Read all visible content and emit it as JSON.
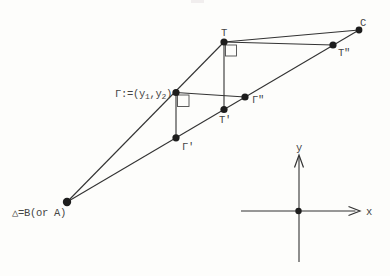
{
  "figure": {
    "canvas": {
      "width": 390,
      "height": 276
    },
    "colors": {
      "background": "#fdfdfb",
      "line": "#333333",
      "dot": "#1d1d1d",
      "text": "#454545",
      "marker": "#4a4a4a",
      "artifact": "#f1eeee"
    },
    "points": [
      {
        "id": "delta",
        "x": 67,
        "y": 202,
        "r": 4.2
      },
      {
        "id": "gamma",
        "x": 176,
        "y": 92.5,
        "r": 3.6
      },
      {
        "id": "gamma-prime",
        "x": 176,
        "y": 137.8,
        "r": 3.6
      },
      {
        "id": "t",
        "x": 224,
        "y": 42,
        "r": 3.6
      },
      {
        "id": "t-prime",
        "x": 224,
        "y": 109.5,
        "r": 3.6
      },
      {
        "id": "gamma-double-prime",
        "x": 245,
        "y": 97,
        "r": 3.6
      },
      {
        "id": "t-double-prime",
        "x": 333,
        "y": 45,
        "r": 3.6
      },
      {
        "id": "c",
        "x": 359,
        "y": 30,
        "r": 3.4
      },
      {
        "id": "axes-origin",
        "x": 298.5,
        "y": 211,
        "r": 3.2
      }
    ],
    "edges": [
      {
        "id": "delta-to-t",
        "x1": 67,
        "y1": 202,
        "x2": 224,
        "y2": 42
      },
      {
        "id": "delta-to-c",
        "x1": 67,
        "y1": 202,
        "x2": 359,
        "y2": 30
      },
      {
        "id": "t-to-c",
        "x1": 224,
        "y1": 42,
        "x2": 359,
        "y2": 30
      },
      {
        "id": "t-to-t-double-prime",
        "x1": 224,
        "y1": 42,
        "x2": 333,
        "y2": 45
      },
      {
        "id": "t-to-t-prime",
        "x1": 224,
        "y1": 42,
        "x2": 224,
        "y2": 109.5
      },
      {
        "id": "gamma-to-gamma-double-prime",
        "x1": 176,
        "y1": 92.5,
        "x2": 245,
        "y2": 97
      },
      {
        "id": "gamma-to-gamma-prime",
        "x1": 176,
        "y1": 92.5,
        "x2": 176,
        "y2": 137.8
      }
    ],
    "right_angle_markers": [
      {
        "id": "right-angle-at-t",
        "x": 225.5,
        "y": 45,
        "size": 11
      },
      {
        "id": "right-angle-at-gamma",
        "x": 177.5,
        "y": 95,
        "size": 11.5
      }
    ],
    "labels": [
      {
        "id": "label-delta",
        "x": 12,
        "y": 215.5,
        "anchor": "start",
        "parts": [
          {
            "t": "△=B(or A)"
          }
        ]
      },
      {
        "id": "label-gamma",
        "x": 172,
        "y": 96.5,
        "anchor": "end",
        "parts": [
          {
            "t": "Γ:=(y"
          },
          {
            "t": "1",
            "sub": true
          },
          {
            "t": ",y"
          },
          {
            "t": "2",
            "sub": true
          },
          {
            "t": ")"
          }
        ]
      },
      {
        "id": "label-gamma-prime",
        "x": 182,
        "y": 150,
        "anchor": "start",
        "parts": [
          {
            "t": "Γ'"
          }
        ]
      },
      {
        "id": "label-t",
        "x": 224,
        "y": 36,
        "anchor": "middle",
        "parts": [
          {
            "t": "T"
          }
        ]
      },
      {
        "id": "label-t-prime",
        "x": 219,
        "y": 122.5,
        "anchor": "start",
        "parts": [
          {
            "t": "T'"
          }
        ]
      },
      {
        "id": "label-gamma-double-prime",
        "x": 252,
        "y": 103,
        "anchor": "start",
        "parts": [
          {
            "t": "Γ\""
          }
        ]
      },
      {
        "id": "label-t-double-prime",
        "x": 338,
        "y": 56,
        "anchor": "start",
        "parts": [
          {
            "t": "T\""
          }
        ]
      },
      {
        "id": "label-c",
        "x": 360,
        "y": 25.5,
        "anchor": "start",
        "parts": [
          {
            "t": "C"
          }
        ]
      },
      {
        "id": "label-x-axis",
        "x": 366,
        "y": 214.5,
        "anchor": "start",
        "parts": [
          {
            "t": "x"
          }
        ]
      },
      {
        "id": "label-y-axis",
        "x": 299,
        "y": 151,
        "anchor": "middle",
        "parts": [
          {
            "t": "y"
          }
        ]
      }
    ],
    "axes": {
      "x_axis": {
        "x1": 241,
        "y1": 211,
        "x2": 355.5,
        "y2": 211,
        "arrow": "348.5,206.5 360,211 348.5,215.5"
      },
      "y_axis": {
        "x1": 299,
        "y1": 157,
        "x2": 299,
        "y2": 262,
        "arrow": "294.5,167.5 299,155 303.5,167.5"
      }
    },
    "scan_artifact": {
      "x": 191,
      "y": 0,
      "width": 13,
      "height": 3
    }
  }
}
